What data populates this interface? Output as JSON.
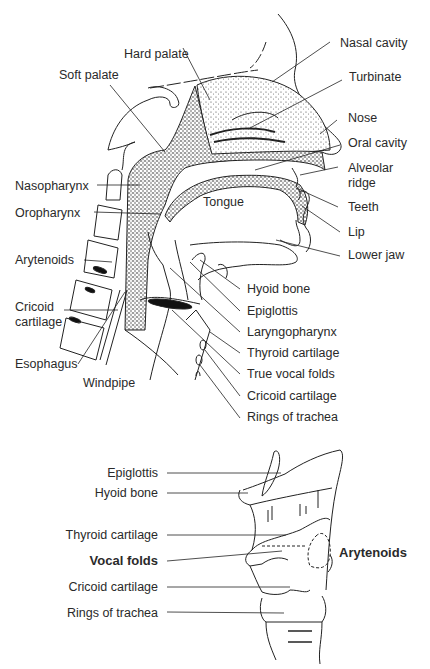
{
  "diagram": {
    "type": "anatomy-illustration",
    "upper_figure": {
      "title": "Sagittal section of head and neck (vocal tract)",
      "labels_left": [
        {
          "id": "soft-palate",
          "text": "Soft palate"
        },
        {
          "id": "hard-palate",
          "text": "Hard palate"
        },
        {
          "id": "nasopharynx",
          "text": "Nasopharynx"
        },
        {
          "id": "oropharynx",
          "text": "Oropharynx"
        },
        {
          "id": "arytenoids",
          "text": "Arytenoids"
        },
        {
          "id": "cricoid-cartilage-left",
          "text": "Cricoid cartilage"
        },
        {
          "id": "esophagus",
          "text": "Esophagus"
        },
        {
          "id": "windpipe",
          "text": "Windpipe"
        }
      ],
      "labels_right": [
        {
          "id": "nasal-cavity",
          "text": "Nasal cavity"
        },
        {
          "id": "turbinate",
          "text": "Turbinate"
        },
        {
          "id": "nose",
          "text": "Nose"
        },
        {
          "id": "oral-cavity",
          "text": "Oral cavity"
        },
        {
          "id": "alveolar-ridge",
          "text": "Alveolar ridge"
        },
        {
          "id": "teeth",
          "text": "Teeth"
        },
        {
          "id": "lip",
          "text": "Lip"
        },
        {
          "id": "lower-jaw",
          "text": "Lower jaw"
        },
        {
          "id": "hyoid-bone",
          "text": "Hyoid bone"
        },
        {
          "id": "epiglottis",
          "text": "Epiglottis"
        },
        {
          "id": "laryngopharynx",
          "text": "Laryngopharynx"
        },
        {
          "id": "thyroid-cartilage",
          "text": "Thyroid cartilage"
        },
        {
          "id": "true-vocal-folds",
          "text": "True vocal folds"
        },
        {
          "id": "cricoid-cartilage-right",
          "text": "Cricoid cartilage"
        },
        {
          "id": "rings-of-trachea",
          "text": "Rings of trachea"
        }
      ],
      "center_labels": [
        {
          "id": "tongue",
          "text": "Tongue"
        }
      ]
    },
    "lower_figure": {
      "title": "Larynx, external side view",
      "labels_left": [
        {
          "id": "epiglottis",
          "text": "Epiglottis",
          "bold": false
        },
        {
          "id": "hyoid-bone",
          "text": "Hyoid bone",
          "bold": false
        },
        {
          "id": "thyroid-cartilage",
          "text": "Thyroid cartilage",
          "bold": false
        },
        {
          "id": "vocal-folds",
          "text": "Vocal folds",
          "bold": true
        },
        {
          "id": "cricoid-cartilage",
          "text": "Cricoid cartilage",
          "bold": false
        },
        {
          "id": "rings-of-trachea",
          "text": "Rings of trachea",
          "bold": false
        }
      ],
      "labels_right": [
        {
          "id": "arytenoids",
          "text": "Arytenoids",
          "bold": true
        }
      ]
    }
  },
  "upper": {
    "hard_palate": "Hard palate",
    "soft_palate": "Soft palate",
    "nasal_cavity": "Nasal cavity",
    "turbinate": "Turbinate",
    "nose": "Nose",
    "oral_cavity": "Oral cavity",
    "alveolar_1": "Alveolar",
    "alveolar_2": "ridge",
    "nasopharynx": "Nasopharynx",
    "oropharynx": "Oropharynx",
    "tongue": "Tongue",
    "teeth": "Teeth",
    "lip": "Lip",
    "lower_jaw": "Lower jaw",
    "arytenoids": "Arytenoids",
    "hyoid_bone": "Hyoid bone",
    "epiglottis": "Epiglottis",
    "cricoid_1": "Cricoid",
    "cricoid_2": "cartilage",
    "laryngopharynx": "Laryngopharynx",
    "thyroid_cartilage": "Thyroid cartilage",
    "esophagus": "Esophagus",
    "true_vocal_folds": "True vocal folds",
    "windpipe": "Windpipe",
    "cricoid_cartilage_r": "Cricoid cartilage",
    "rings_of_trachea": "Rings of trachea"
  },
  "lower": {
    "epiglottis": "Epiglottis",
    "hyoid_bone": "Hyoid bone",
    "thyroid_cartilage": "Thyroid cartilage",
    "vocal_folds": "Vocal folds",
    "arytenoids": "Arytenoids",
    "cricoid_cartilage": "Cricoid cartilage",
    "rings_of_trachea": "Rings of trachea"
  }
}
